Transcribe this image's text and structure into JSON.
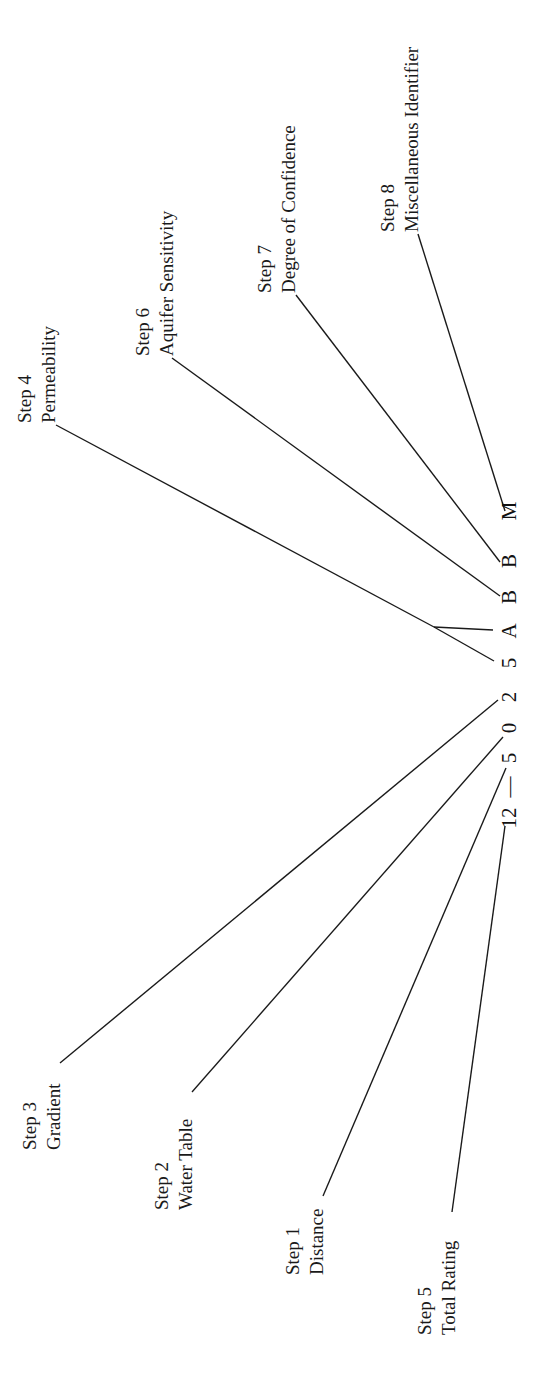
{
  "diagram": {
    "code": {
      "characters": [
        "12",
        "—",
        "5",
        "0",
        "2",
        "5",
        "A",
        "B",
        "B",
        "M"
      ],
      "full_code": "12—5 0 2 5 A B B M"
    },
    "steps": [
      {
        "step": "Step 1",
        "name": "Distance",
        "code_char": "0"
      },
      {
        "step": "Step 2",
        "name": "Water Table",
        "code_char": "0"
      },
      {
        "step": "Step 3",
        "name": "Gradient",
        "code_char": "2"
      },
      {
        "step": "Step 4",
        "name": "Permeability",
        "code_char": "5A"
      },
      {
        "step": "Step 5",
        "name": "Total Rating",
        "code_char": "12"
      },
      {
        "step": "Step 6",
        "name": "Aquifer Sensitivity",
        "code_char": "B"
      },
      {
        "step": "Step 7",
        "name": "Degree of Confidence",
        "code_char": "B"
      },
      {
        "step": "Step 8",
        "name": "Miscellaneous Identifier",
        "code_char": "M"
      }
    ],
    "colors": {
      "background": "#ffffff",
      "ink": "#1a1a1a"
    }
  }
}
